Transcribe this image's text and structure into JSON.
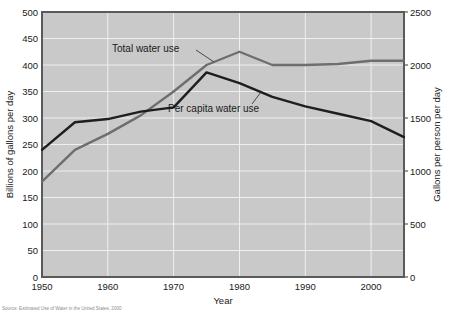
{
  "chart_data": {
    "type": "line",
    "title": "",
    "xlabel": "Year",
    "ylabel": "Billions of gallons per day",
    "y2label": "Gallons per person per day",
    "xlim": [
      1950,
      2005
    ],
    "ylim": [
      0,
      500
    ],
    "y2lim": [
      0,
      2500
    ],
    "xticks": [
      1950,
      1960,
      1970,
      1980,
      1990,
      2000
    ],
    "xticklabels": [
      "1950",
      "1960",
      "1970",
      "1980",
      "1990",
      "2000"
    ],
    "yticks": [
      0,
      50,
      100,
      150,
      200,
      250,
      300,
      350,
      400,
      450,
      500
    ],
    "yticklabels": [
      "0",
      "50",
      "100",
      "150",
      "200",
      "250",
      "300",
      "350",
      "400",
      "450",
      "500"
    ],
    "y2ticks": [
      0,
      500,
      1000,
      1500,
      2000,
      2500
    ],
    "y2ticklabels": [
      "0",
      "500",
      "1000",
      "1500",
      "2000",
      "2500"
    ],
    "grid": true,
    "legend_position": "inline-annotations",
    "series": [
      {
        "name": "Total water use",
        "axis": "left",
        "color": "#6e6e6e",
        "x": [
          1950,
          1955,
          1960,
          1965,
          1970,
          1975,
          1980,
          1985,
          1990,
          1995,
          2000,
          2005
        ],
        "values": [
          180,
          240,
          270,
          305,
          350,
          400,
          425,
          400,
          400,
          402,
          408,
          408
        ]
      },
      {
        "name": "Per capita water use",
        "axis": "right",
        "color": "#1e1e1e",
        "x": [
          1950,
          1955,
          1960,
          1965,
          1970,
          1975,
          1980,
          1985,
          1990,
          1995,
          2000,
          2005
        ],
        "values": [
          1200,
          1460,
          1490,
          1560,
          1600,
          1930,
          1830,
          1700,
          1610,
          1540,
          1470,
          1320
        ]
      }
    ],
    "annotations": [
      {
        "text": "Total water use",
        "x": 1963,
        "y": 432
      },
      {
        "text": "Per capita water use",
        "x": 1972,
        "y": 320
      }
    ],
    "source_note": "Source: Estimated Use of Water in the United States, 2000"
  }
}
